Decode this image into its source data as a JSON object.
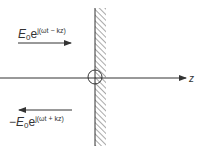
{
  "diagram": {
    "incident_wave": {
      "base": "E",
      "sub": "0",
      "e": "e",
      "exponent": "j(ωt − kz)",
      "direction": "right"
    },
    "reflected_wave": {
      "sign": "−",
      "base": "E",
      "sub": "0",
      "e": "e",
      "exponent": "j(ωt + kz)",
      "direction": "left"
    },
    "axis": {
      "label": "z"
    },
    "colors": {
      "line": "#333333",
      "hatch": "#555555",
      "background": "#ffffff"
    }
  }
}
